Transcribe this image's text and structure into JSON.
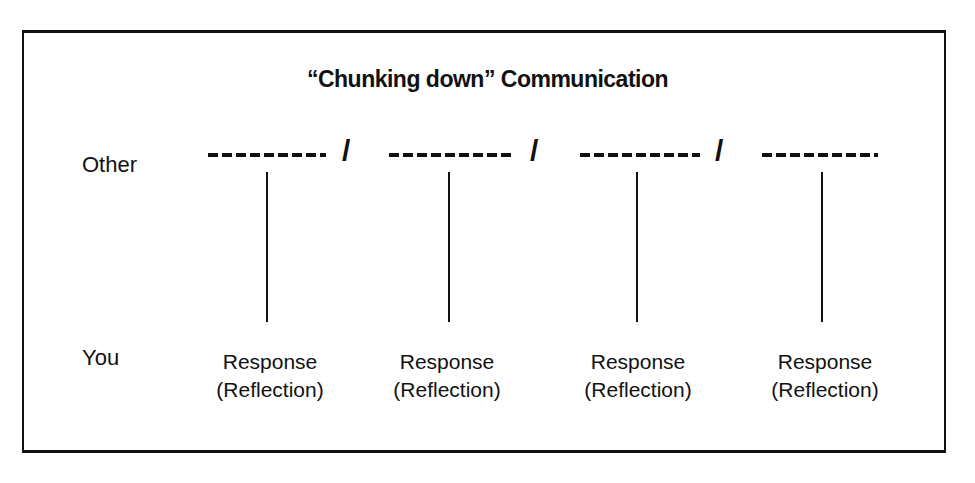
{
  "title": "“Chunking down” Communication",
  "rows": {
    "other": "Other",
    "you": "You"
  },
  "separator": "/",
  "responses": [
    {
      "line1": "Response",
      "line2": "(Reflection)"
    },
    {
      "line1": "Response",
      "line2": "(Reflection)"
    },
    {
      "line1": "Response",
      "line2": "(Reflection)"
    },
    {
      "line1": "Response",
      "line2": "(Reflection)"
    }
  ]
}
